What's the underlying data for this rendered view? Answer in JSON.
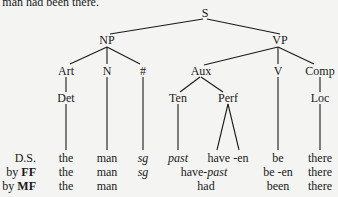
{
  "caption": "e man had been there.",
  "tree": {
    "nodes": {
      "S": "S",
      "NP": "NP",
      "VP": "VP",
      "Art": "Art",
      "N": "N",
      "Num": "#",
      "Aux": "Aux",
      "V": "V",
      "Comp": "Comp",
      "Det": "Det",
      "Ten": "Ten",
      "Perf": "Perf",
      "Loc": "Loc"
    }
  },
  "rows": {
    "ds": {
      "label": "D.S.",
      "cells": [
        "the",
        "man",
        "sg",
        "past",
        "have -en",
        "be",
        "there"
      ]
    },
    "ff": {
      "label_prefix": "by ",
      "label_bold": "FF",
      "cells": [
        "the",
        "man",
        "sg",
        "have-",
        "past",
        "be -en",
        "there"
      ]
    },
    "mf": {
      "label_prefix": "by ",
      "label_bold": "MF",
      "cells": [
        "the",
        "man",
        "had",
        "been",
        "there"
      ]
    }
  }
}
